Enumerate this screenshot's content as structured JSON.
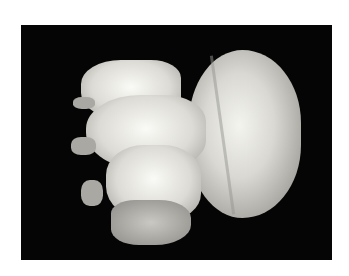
{
  "image": {
    "subject": "jellyfish",
    "description": "Pale translucent jellyfish with domed bell and frilled oral arms on black background",
    "colors": {
      "background": "#050505",
      "border": "#ffffff",
      "bell": "#d9d8d2"
    }
  }
}
